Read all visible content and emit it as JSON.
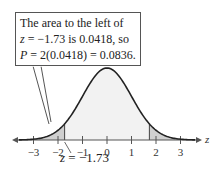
{
  "chart_data": {
    "type": "area",
    "title": "",
    "distribution": "standard normal",
    "xlabel": "z",
    "ylabel": "",
    "x_ticks": [
      -3,
      -2,
      -1,
      0,
      1,
      2,
      3
    ],
    "xlim": [
      -3.5,
      3.5
    ],
    "shaded_regions": [
      {
        "from": -3.5,
        "to": -1.73,
        "area": 0.0418
      },
      {
        "from": 1.73,
        "to": 3.5,
        "area": 0.0418
      }
    ],
    "annotations": [
      "The area to the left of z = −1.73 is 0.0418, so P = 2(0.0418) = 0.0836.",
      "z = −1.73"
    ]
  },
  "callout": {
    "line1": "The area to the left of",
    "line2_var": "z",
    "line2_rest": " = −1.73 is 0.0418, so",
    "line3_var": "P",
    "line3_rest": " = 2(0.0418) = 0.0836."
  },
  "axis": {
    "label": "z",
    "ticks": [
      "−3",
      "−2",
      "−1",
      "0",
      "1",
      "2",
      "3"
    ]
  },
  "marker": {
    "var": "z",
    "rest": " = −1.73"
  },
  "colors": {
    "curve": "#222222",
    "tail": "#cfcfcf",
    "center": "#f2f2f2",
    "axis": "#555555"
  }
}
